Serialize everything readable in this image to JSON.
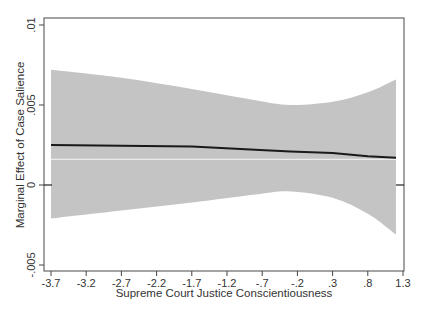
{
  "chart_data": {
    "type": "line",
    "title": "",
    "xlabel": "Supreme Court Justice Conscientiousness",
    "ylabel": "Marginal Effect of Case Salience",
    "xlim": [
      -3.7,
      1.3
    ],
    "ylim": [
      -0.005,
      0.01
    ],
    "x_ticks": [
      -3.7,
      -3.2,
      -2.7,
      -2.2,
      -1.7,
      -1.2,
      -0.7,
      -0.2,
      0.3,
      0.8,
      1.3
    ],
    "x_tick_labels": [
      "-3.7",
      "-3.2",
      "-2.7",
      "-2.2",
      "-1.7",
      "-1.2",
      "-.7",
      "-.2",
      ".3",
      ".8",
      "1.3"
    ],
    "y_ticks": [
      -0.005,
      0,
      0.005,
      0.01
    ],
    "y_tick_labels": [
      "-.005",
      "0",
      ".005",
      ".01"
    ],
    "grid": false,
    "legend": null,
    "reference_line": {
      "y": 0,
      "style": "tick marks at axes"
    },
    "series": [
      {
        "name": "Marginal effect",
        "style": "solid dark line",
        "color": "#1a1a1a",
        "x": [
          -3.7,
          -2.7,
          -1.7,
          -0.8,
          -0.3,
          0.3,
          0.8,
          1.2
        ],
        "values": [
          0.0025,
          0.00245,
          0.0024,
          0.0022,
          0.0021,
          0.002,
          0.0018,
          0.0017
        ]
      },
      {
        "name": "Reference (lighter line)",
        "style": "thin light line",
        "color": "#e8e8e8",
        "x": [
          -3.7,
          1.2
        ],
        "values": [
          0.0016,
          0.0016
        ]
      },
      {
        "name": "95% CI",
        "style": "shaded band",
        "color": "#c4c4c4",
        "x": [
          -3.7,
          -2.7,
          -1.7,
          -0.8,
          -0.3,
          0.3,
          0.8,
          1.2
        ],
        "upper": [
          0.0072,
          0.0067,
          0.006,
          0.0053,
          0.005,
          0.0052,
          0.0058,
          0.0066
        ],
        "lower": [
          -0.0021,
          -0.0016,
          -0.0011,
          -0.0006,
          -0.0004,
          -0.0008,
          -0.0018,
          -0.0031
        ]
      }
    ]
  },
  "colors": {
    "band": "#c4c4c4",
    "line": "#1a1a1a",
    "axis": "#555555",
    "background": "#ffffff"
  }
}
